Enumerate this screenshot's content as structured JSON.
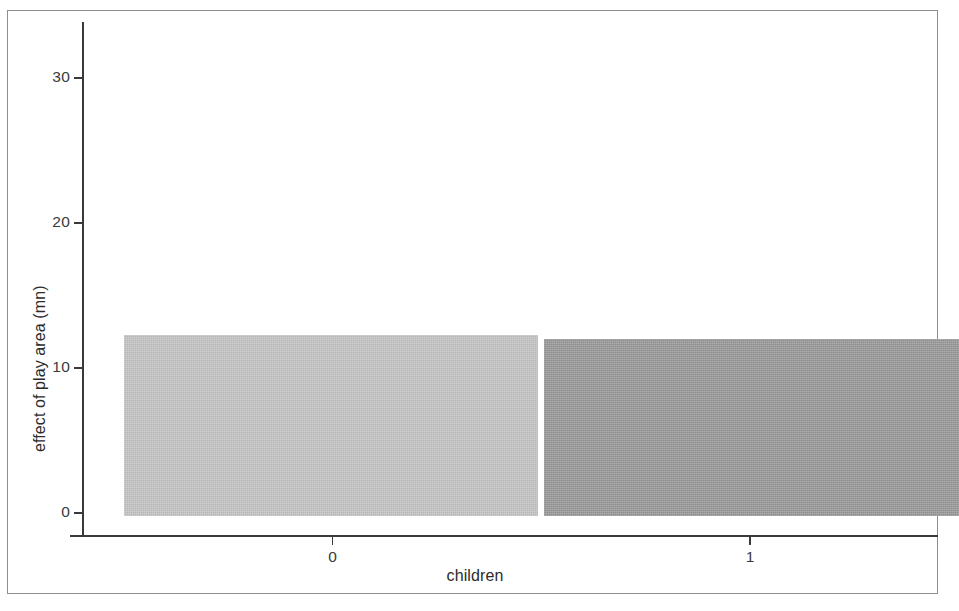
{
  "chart_data": {
    "type": "bar",
    "title": "",
    "xlabel": "children",
    "ylabel": "effect of play area (mn)",
    "categories": [
      "0",
      "1"
    ],
    "values": [
      12.3,
      12.0
    ],
    "series": [
      {
        "name": "effect of play area (mn)",
        "values": [
          12.3,
          12.0
        ],
        "colors": [
          "#c5c5c5",
          "#9a9a9a"
        ]
      }
    ],
    "xlim": [
      -0.6,
      1.45
    ],
    "ylim": [
      0,
      35.5
    ],
    "yticks": [
      0,
      10,
      20,
      30
    ],
    "ytick_labels": [
      "0",
      "10",
      "20",
      "30"
    ],
    "xticks": [
      0,
      1
    ],
    "xtick_labels": [
      "0",
      "1"
    ],
    "grid": false,
    "legend": "none",
    "bar_colors": {
      "category_0": "#c5c5c5",
      "category_1": "#9a9a9a"
    },
    "axis_color": "#3a3a3a",
    "frame_color": "#8e8e8e",
    "background": "#ffffff"
  },
  "figure": {
    "frame_label": "figure-border"
  }
}
